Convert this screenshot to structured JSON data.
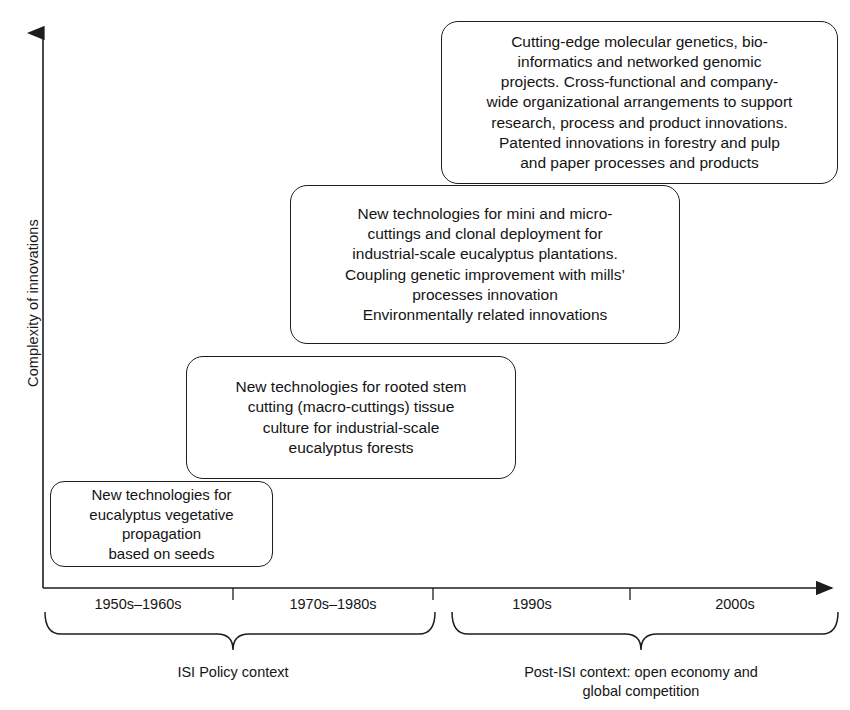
{
  "axes": {
    "y_title": "Complexity of innovations",
    "x_arrow": "right-arrow",
    "y_arrow": "up-arrow"
  },
  "stages": [
    {
      "id": "stage-1",
      "name": "innovation-stage-box-1",
      "lines": [
        "New technologies for",
        "eucalyptus vegetative",
        "propagation",
        "based on seeds"
      ]
    },
    {
      "id": "stage-2",
      "name": "innovation-stage-box-2",
      "lines": [
        "New technologies for rooted stem",
        "cutting (macro-cuttings) tissue",
        "culture for industrial-scale",
        "eucalyptus forests"
      ]
    },
    {
      "id": "stage-3",
      "name": "innovation-stage-box-3",
      "lines": [
        "New technologies for mini and micro-",
        "cuttings and clonal deployment for",
        "industrial-scale eucalyptus plantations.",
        "Coupling genetic improvement with mills’",
        "processes innovation",
        "Environmentally related innovations"
      ]
    },
    {
      "id": "stage-4",
      "name": "innovation-stage-box-4",
      "lines": [
        "Cutting-edge molecular genetics, bio-",
        "informatics and networked genomic",
        "projects. Cross-functional and company-",
        "wide organizational arrangements to support",
        "research, process and product innovations.",
        "Patented innovations in forestry and pulp",
        "and paper processes and products"
      ]
    }
  ],
  "periods": [
    {
      "label": "1950s–1960s",
      "center_x": 138
    },
    {
      "label": "1970s–1980s",
      "center_x": 333
    },
    {
      "label": "1990s",
      "center_x": 532
    },
    {
      "label": "2000s",
      "center_x": 735
    }
  ],
  "brackets": [
    {
      "name": "isi-policy-bracket",
      "lines": [
        "ISI Policy context"
      ],
      "center_x": 233,
      "label_top": 663
    },
    {
      "name": "post-isi-bracket",
      "lines": [
        "Post-ISI context: open economy and",
        "global competition"
      ],
      "center_x": 641,
      "label_top": 663
    }
  ],
  "colors": {
    "stroke": "#1d1d1d",
    "text": "#141414",
    "background": "#ffffff"
  }
}
